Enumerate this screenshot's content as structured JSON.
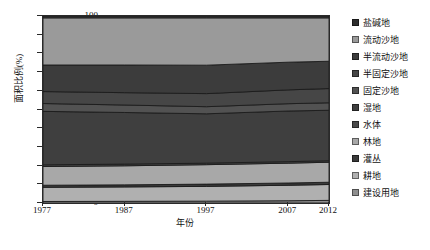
{
  "chart_data": {
    "type": "area",
    "title": "",
    "xlabel": "年份",
    "ylabel": "面积比例(%)",
    "x": [
      1977,
      1987,
      1997,
      2007,
      2012
    ],
    "xtick_labels": [
      "1977",
      "1987",
      "1997",
      "2007",
      "2012"
    ],
    "ytick_labels": [
      "0",
      "10",
      "20",
      "30",
      "40",
      "50",
      "60",
      "70",
      "80",
      "90",
      "100"
    ],
    "ylim": [
      0,
      100
    ],
    "xlim": [
      1977,
      2012
    ],
    "grid": false,
    "legend_position": "right",
    "stacked": true,
    "stack_order_top_to_bottom": [
      "盐碱地",
      "流动沙地",
      "半流动沙地",
      "半固定沙地",
      "固定沙地",
      "湿地",
      "水体",
      "林地",
      "灌丛",
      "耕地",
      "建设用地"
    ],
    "series": [
      {
        "name": "建设用地",
        "color": "#8f8f8f",
        "values": [
          0.8,
          0.9,
          1.0,
          1.2,
          1.4
        ]
      },
      {
        "name": "耕地",
        "color": "#b0b0b0",
        "values": [
          7.6,
          7.7,
          7.9,
          8.3,
          8.5
        ]
      },
      {
        "name": "灌丛",
        "color": "#3a3a3a",
        "values": [
          1.1,
          1.1,
          1.2,
          1.2,
          1.2
        ]
      },
      {
        "name": "林地",
        "color": "#a8a8a8",
        "values": [
          10.0,
          10.2,
          10.4,
          10.6,
          10.7
        ]
      },
      {
        "name": "水体",
        "color": "#4a4a4a",
        "values": [
          0.9,
          0.9,
          0.8,
          0.8,
          0.8
        ]
      },
      {
        "name": "湿地",
        "color": "#3f3f3f",
        "values": [
          28.6,
          27.6,
          26.4,
          27.1,
          27.0
        ]
      },
      {
        "name": "固定沙地",
        "color": "#525252",
        "values": [
          4.2,
          4.0,
          3.8,
          3.9,
          4.0
        ]
      },
      {
        "name": "半固定沙地",
        "color": "#464646",
        "values": [
          6.4,
          6.6,
          7.0,
          7.4,
          7.6
        ]
      },
      {
        "name": "半流动沙地",
        "color": "#3c3c3c",
        "values": [
          14.2,
          14.8,
          15.2,
          14.8,
          14.6
        ]
      },
      {
        "name": "流动沙地",
        "color": "#9a9a9a",
        "values": [
          25.2,
          25.2,
          25.3,
          23.7,
          23.2
        ]
      },
      {
        "name": "盐碱地",
        "color": "#2e2e2e",
        "values": [
          1.0,
          1.0,
          1.0,
          1.0,
          1.0
        ]
      }
    ],
    "cumulative_top_boundaries": {
      "note": "cumulative % from bottom of stack, top boundary of each band, per year",
      "建设用地": [
        0.8,
        0.9,
        1.0,
        1.2,
        1.4
      ],
      "耕地": [
        8.4,
        8.6,
        8.9,
        9.5,
        9.9
      ],
      "灌丛": [
        9.5,
        9.7,
        10.1,
        10.7,
        11.1
      ],
      "林地": [
        19.5,
        19.9,
        20.5,
        21.3,
        21.8
      ],
      "水体": [
        20.4,
        20.8,
        21.3,
        22.1,
        22.6
      ],
      "湿地": [
        49.0,
        48.4,
        47.7,
        49.2,
        49.6
      ],
      "固定沙地": [
        53.2,
        52.4,
        51.5,
        53.1,
        53.6
      ],
      "半固定沙地": [
        59.6,
        59.0,
        58.5,
        60.5,
        61.2
      ],
      "半流动沙地": [
        73.8,
        73.8,
        73.7,
        75.3,
        75.8
      ],
      "流动沙地": [
        99.0,
        99.0,
        99.0,
        99.0,
        99.0
      ],
      "盐碱地": [
        100,
        100,
        100,
        100,
        100
      ]
    }
  },
  "axes": {
    "y_title": "面积比例(%)",
    "x_title": "年份",
    "y_ticks": [
      "100",
      "90",
      "80",
      "70",
      "60",
      "50",
      "40",
      "30",
      "20",
      "10",
      "0"
    ],
    "x_ticks": [
      "1977",
      "1987",
      "1997",
      "2007",
      "2012"
    ]
  },
  "legend": {
    "items": [
      {
        "label": "盐碱地",
        "color": "#2e2e2e"
      },
      {
        "label": "流动沙地",
        "color": "#9a9a9a"
      },
      {
        "label": "半流动沙地",
        "color": "#3c3c3c"
      },
      {
        "label": "半固定沙地",
        "color": "#464646"
      },
      {
        "label": "固定沙地",
        "color": "#525252"
      },
      {
        "label": "湿地",
        "color": "#3f3f3f"
      },
      {
        "label": "水体",
        "color": "#4a4a4a"
      },
      {
        "label": "林地",
        "color": "#a8a8a8"
      },
      {
        "label": "灌丛",
        "color": "#3a3a3a"
      },
      {
        "label": "耕地",
        "color": "#b0b0b0"
      },
      {
        "label": "建设用地",
        "color": "#8f8f8f"
      }
    ]
  }
}
